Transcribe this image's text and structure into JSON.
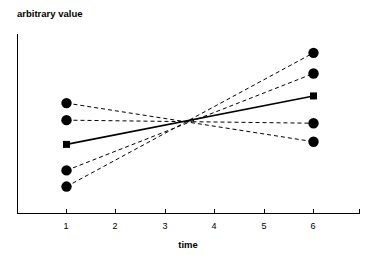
{
  "chart_data": {
    "type": "line",
    "title": "",
    "xlabel": "time",
    "ylabel": "arbitrary value",
    "xlim": [
      0.0,
      7.0
    ],
    "ylim": [
      0.0,
      10.0
    ],
    "grid": false,
    "legend": false,
    "x_ticks": [
      1,
      2,
      3,
      4,
      5,
      6
    ],
    "x_tick_labels": [
      "1",
      "2",
      "3",
      "4",
      "5",
      "6"
    ],
    "y_ticks": [],
    "y_tick_labels": [],
    "x": [
      1,
      6
    ],
    "series": [
      {
        "name": "subject-1",
        "style": "dashed",
        "marker": "circle",
        "values": [
          6.15,
          4.0
        ]
      },
      {
        "name": "subject-2",
        "style": "dashed",
        "marker": "circle",
        "values": [
          5.2,
          5.03
        ]
      },
      {
        "name": "mean",
        "style": "solid",
        "marker": "square",
        "values": [
          3.85,
          6.55
        ]
      },
      {
        "name": "subject-3",
        "style": "dashed",
        "marker": "circle",
        "values": [
          2.4,
          7.8
        ]
      },
      {
        "name": "subject-4",
        "style": "dashed",
        "marker": "circle",
        "values": [
          1.5,
          8.95
        ]
      }
    ],
    "annotations": []
  },
  "axes": {
    "y_axis_label": "arbitrary value",
    "x_axis_label": "time"
  },
  "colors": {
    "ink": "#000000",
    "background": "#ffffff"
  }
}
